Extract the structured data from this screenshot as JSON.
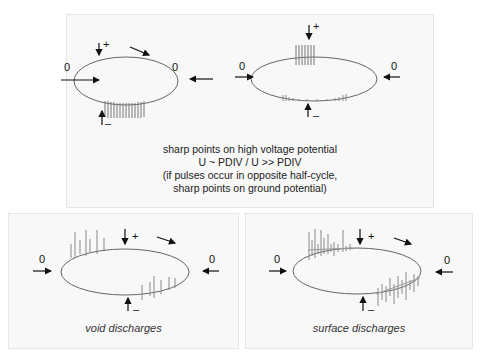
{
  "panels": {
    "top": {
      "description": [
        "sharp points on high voltage potential",
        "U ~ PDIV / U >> PDIV",
        "(if pulses occur in opposite half-cycle,",
        "sharp points on ground potential)"
      ],
      "diagrams": [
        {
          "zero_left": "0",
          "zero_right": "0",
          "plus": "+",
          "minus": "–",
          "pulses": "negative half-cycle, equal height"
        },
        {
          "zero_left": "0",
          "zero_right": "0",
          "plus": "+",
          "minus": "–",
          "pulses": "large on positive peak, small on negative half-cycle"
        }
      ]
    },
    "void": {
      "caption": "void discharges",
      "zero_left": "0",
      "zero_right": "0",
      "plus": "+",
      "minus": "–"
    },
    "surface": {
      "caption": "surface discharges",
      "zero_left": "0",
      "zero_right": "0",
      "plus": "+",
      "minus": "–"
    }
  },
  "colors": {
    "ellipse": "#666666",
    "pulse": "#888888",
    "arrow": "#111111",
    "panel_bg": "#f8f8f8"
  }
}
